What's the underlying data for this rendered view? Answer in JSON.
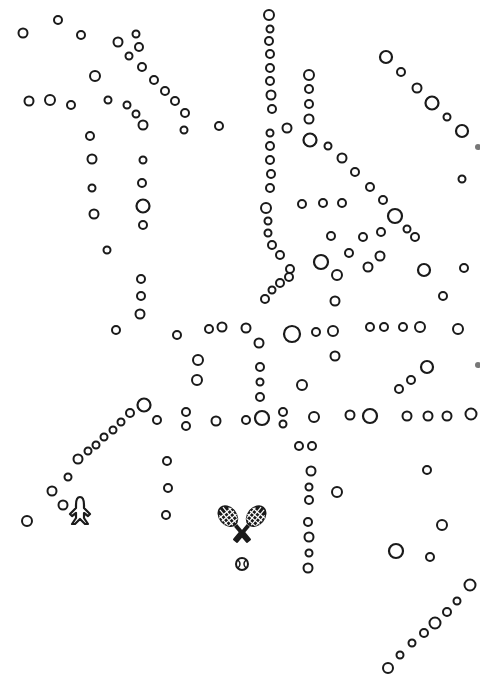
{
  "map": {
    "width": 480,
    "height": 682,
    "background": "#ffffff",
    "ink_color": "#1a1a1a",
    "icons": [
      {
        "name": "airplane-icon",
        "x": 80,
        "y": 510
      },
      {
        "name": "tennis-rackets-icon",
        "x": 242,
        "y": 533
      }
    ],
    "stops": [
      [
        23,
        33,
        4.5
      ],
      [
        58,
        20,
        4
      ],
      [
        81,
        35,
        4
      ],
      [
        95,
        76,
        5
      ],
      [
        118,
        42,
        4.5
      ],
      [
        136,
        34,
        3.5
      ],
      [
        139,
        47,
        4
      ],
      [
        129,
        56,
        3.5
      ],
      [
        142,
        67,
        4
      ],
      [
        154,
        80,
        4
      ],
      [
        165,
        91,
        4
      ],
      [
        175,
        101,
        4
      ],
      [
        185,
        113,
        4
      ],
      [
        184,
        130,
        3.5
      ],
      [
        219,
        126,
        4
      ],
      [
        29,
        101,
        4.5
      ],
      [
        50,
        100,
        5
      ],
      [
        71,
        105,
        4
      ],
      [
        108,
        100,
        3.5
      ],
      [
        127,
        105,
        3.5
      ],
      [
        136,
        114,
        3.5
      ],
      [
        143,
        125,
        4.5
      ],
      [
        90,
        136,
        4
      ],
      [
        92,
        159,
        4.5
      ],
      [
        92,
        188,
        3.5
      ],
      [
        94,
        214,
        4.5
      ],
      [
        107,
        250,
        3.5
      ],
      [
        143,
        160,
        3.5
      ],
      [
        142,
        183,
        4
      ],
      [
        143,
        206,
        6.5
      ],
      [
        143,
        225,
        4
      ],
      [
        141,
        279,
        4
      ],
      [
        141,
        296,
        4
      ],
      [
        140,
        314,
        4.5
      ],
      [
        116,
        330,
        4
      ],
      [
        269,
        15,
        5
      ],
      [
        270,
        29,
        3.5
      ],
      [
        269,
        41,
        4
      ],
      [
        270,
        54,
        4
      ],
      [
        270,
        68,
        4
      ],
      [
        270,
        81,
        4
      ],
      [
        271,
        95,
        4.5
      ],
      [
        272,
        109,
        4
      ],
      [
        270,
        133,
        3.5
      ],
      [
        270,
        146,
        4
      ],
      [
        270,
        160,
        4
      ],
      [
        271,
        174,
        4
      ],
      [
        270,
        188,
        4
      ],
      [
        266,
        208,
        5
      ],
      [
        268,
        221,
        3.5
      ],
      [
        268,
        233,
        3.5
      ],
      [
        287,
        128,
        4.5
      ],
      [
        309,
        75,
        5
      ],
      [
        309,
        89,
        4
      ],
      [
        309,
        104,
        4
      ],
      [
        309,
        119,
        4.5
      ],
      [
        310,
        140,
        6.5
      ],
      [
        328,
        146,
        3.5
      ],
      [
        342,
        158,
        4.5
      ],
      [
        355,
        172,
        4
      ],
      [
        370,
        187,
        4
      ],
      [
        383,
        200,
        4
      ],
      [
        395,
        216,
        7
      ],
      [
        407,
        229,
        3.5
      ],
      [
        415,
        237,
        4
      ],
      [
        272,
        245,
        4
      ],
      [
        280,
        255,
        4
      ],
      [
        290,
        269,
        4
      ],
      [
        289,
        277,
        4
      ],
      [
        280,
        283,
        4
      ],
      [
        272,
        290,
        3.5
      ],
      [
        265,
        299,
        4
      ],
      [
        302,
        204,
        4
      ],
      [
        323,
        203,
        4
      ],
      [
        342,
        203,
        4
      ],
      [
        331,
        236,
        4
      ],
      [
        363,
        237,
        4
      ],
      [
        349,
        253,
        4
      ],
      [
        321,
        262,
        7
      ],
      [
        337,
        275,
        5
      ],
      [
        368,
        267,
        4.5
      ],
      [
        380,
        256,
        4.5
      ],
      [
        381,
        232,
        4
      ],
      [
        335,
        301,
        4.5
      ],
      [
        386,
        57,
        6
      ],
      [
        401,
        72,
        4
      ],
      [
        417,
        88,
        4.5
      ],
      [
        432,
        103,
        6.5
      ],
      [
        447,
        117,
        3.5
      ],
      [
        462,
        131,
        6
      ],
      [
        462,
        179,
        3.5
      ],
      [
        424,
        270,
        6
      ],
      [
        464,
        268,
        4
      ],
      [
        443,
        296,
        4
      ],
      [
        177,
        335,
        4
      ],
      [
        209,
        329,
        4
      ],
      [
        222,
        327,
        4.5
      ],
      [
        246,
        328,
        4.5
      ],
      [
        259,
        343,
        4.5
      ],
      [
        292,
        334,
        8
      ],
      [
        316,
        332,
        4
      ],
      [
        333,
        331,
        5
      ],
      [
        370,
        327,
        4
      ],
      [
        384,
        327,
        4
      ],
      [
        403,
        327,
        4
      ],
      [
        420,
        327,
        5
      ],
      [
        458,
        329,
        5
      ],
      [
        198,
        360,
        5
      ],
      [
        197,
        380,
        5
      ],
      [
        260,
        367,
        4
      ],
      [
        260,
        382,
        3.5
      ],
      [
        260,
        397,
        4
      ],
      [
        335,
        356,
        4.5
      ],
      [
        302,
        385,
        5
      ],
      [
        427,
        367,
        6
      ],
      [
        411,
        380,
        4
      ],
      [
        399,
        389,
        4
      ],
      [
        144,
        405,
        6.5
      ],
      [
        157,
        420,
        4
      ],
      [
        186,
        412,
        4
      ],
      [
        186,
        426,
        4
      ],
      [
        216,
        421,
        4.5
      ],
      [
        246,
        420,
        4
      ],
      [
        262,
        418,
        7
      ],
      [
        283,
        412,
        4
      ],
      [
        283,
        424,
        3.5
      ],
      [
        314,
        417,
        5
      ],
      [
        350,
        415,
        4.5
      ],
      [
        370,
        416,
        7
      ],
      [
        407,
        416,
        4.5
      ],
      [
        428,
        416,
        4.5
      ],
      [
        447,
        416,
        4.5
      ],
      [
        471,
        414,
        5.5
      ],
      [
        130,
        413,
        4
      ],
      [
        121,
        422,
        3.5
      ],
      [
        113,
        430,
        3.5
      ],
      [
        104,
        437,
        3.5
      ],
      [
        96,
        445,
        3.5
      ],
      [
        88,
        451,
        3.5
      ],
      [
        78,
        459,
        4.5
      ],
      [
        68,
        477,
        3.5
      ],
      [
        52,
        491,
        4.5
      ],
      [
        63,
        505,
        4.5
      ],
      [
        27,
        521,
        5
      ],
      [
        167,
        461,
        4
      ],
      [
        168,
        488,
        4
      ],
      [
        166,
        515,
        4
      ],
      [
        299,
        446,
        4
      ],
      [
        312,
        446,
        4
      ],
      [
        311,
        471,
        4.5
      ],
      [
        309,
        487,
        3.5
      ],
      [
        309,
        500,
        4
      ],
      [
        337,
        492,
        5
      ],
      [
        308,
        522,
        4
      ],
      [
        309,
        537,
        4.5
      ],
      [
        309,
        553,
        3.5
      ],
      [
        308,
        568,
        4.5
      ],
      [
        427,
        470,
        4
      ],
      [
        442,
        525,
        5
      ],
      [
        396,
        551,
        7
      ],
      [
        430,
        557,
        4
      ],
      [
        470,
        585,
        5.5
      ],
      [
        457,
        601,
        3.5
      ],
      [
        447,
        612,
        4
      ],
      [
        435,
        623,
        5.5
      ],
      [
        424,
        633,
        4
      ],
      [
        412,
        643,
        3.5
      ],
      [
        400,
        655,
        3.5
      ],
      [
        388,
        668,
        5
      ]
    ]
  }
}
